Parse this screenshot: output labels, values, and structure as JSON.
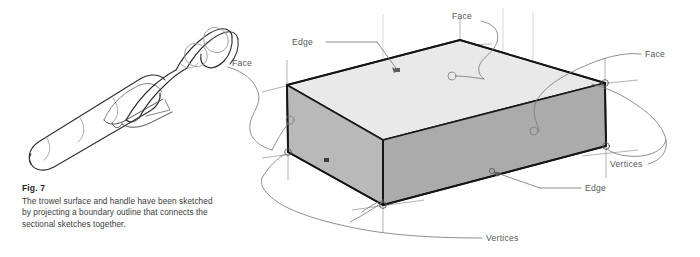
{
  "figure": {
    "number_label": "Fig. 7",
    "caption": "The trowel surface and handle have been sketched by projecting a boundary outline that connects the sectional sketches together."
  },
  "left_illustration": {
    "name": "trowel-sketch",
    "description": "Line drawing of a trowel with handle, boundary outline sketch"
  },
  "right_illustration": {
    "name": "box-solid-diagram",
    "description": "Shaded rectangular box solid with callout leader lines"
  },
  "annotations": [
    {
      "id": "face-left",
      "text": "Face",
      "x": 232,
      "y": 58
    },
    {
      "id": "edge-top",
      "text": "Edge",
      "x": 292,
      "y": 37
    },
    {
      "id": "face-top",
      "text": "Face",
      "x": 452,
      "y": 11
    },
    {
      "id": "face-right",
      "text": "Face",
      "x": 645,
      "y": 49
    },
    {
      "id": "vertices-right",
      "text": "Vertices",
      "x": 610,
      "y": 159
    },
    {
      "id": "edge-bottom",
      "text": "Edge",
      "x": 585,
      "y": 183
    },
    {
      "id": "vertices-bottom",
      "text": "Vertices",
      "x": 486,
      "y": 233
    }
  ],
  "colors": {
    "face_top": "#e9e9e9",
    "face_front": "#ababab",
    "face_left": "#b9b9b9",
    "outline": "#1a1a1a",
    "construction_line": "#8a8a8d",
    "leader_line": "#6d6d70",
    "caption_title": "#231f20",
    "caption_body": "#3a3a3c",
    "background": "#ffffff"
  }
}
